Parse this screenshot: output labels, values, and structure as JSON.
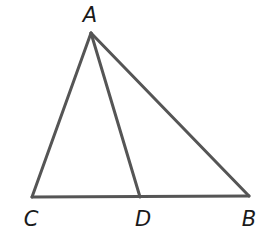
{
  "diagram": {
    "type": "geometry-triangle",
    "stroke_color": "#555555",
    "label_color": "#1a1a1a",
    "points": {
      "A": {
        "label": "A",
        "x": 91,
        "y": 33,
        "label_x": 90,
        "label_y": 22
      },
      "C": {
        "label": "C",
        "x": 32,
        "y": 197,
        "label_x": 31,
        "label_y": 226
      },
      "D": {
        "label": "D",
        "x": 140,
        "y": 197,
        "label_x": 143,
        "label_y": 226
      },
      "B": {
        "label": "B",
        "x": 249,
        "y": 196,
        "label_x": 249,
        "label_y": 226
      }
    },
    "segments": [
      [
        "A",
        "C"
      ],
      [
        "A",
        "B"
      ],
      [
        "A",
        "D"
      ],
      [
        "C",
        "B"
      ]
    ]
  }
}
